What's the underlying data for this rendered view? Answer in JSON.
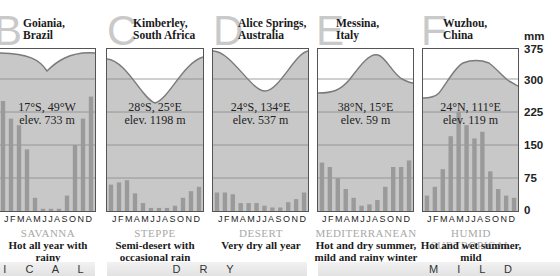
{
  "axis": {
    "unit": "mm",
    "ticks": [
      "375",
      "300",
      "225",
      "150",
      "75",
      "0"
    ]
  },
  "months_label": [
    "J",
    "F",
    "M",
    "A",
    "M",
    "J",
    "J",
    "A",
    "S",
    "O",
    "N",
    "D"
  ],
  "bands": {
    "tropical": "I C A L",
    "dry": "D R Y",
    "mild": "M I L D"
  },
  "panels": [
    {
      "letter": "B",
      "place_line1": "Goiania,",
      "place_line2": "Brazil",
      "coords": "17°S, 49°W",
      "elev": "elev. 733 m",
      "type": "SAVANNA",
      "desc_line1": "Hot all year with rainy",
      "desc_line2": "and dry seasons"
    },
    {
      "letter": "C",
      "place_line1": "Kimberley,",
      "place_line2": "South Africa",
      "coords": "28°S, 25°E",
      "elev": "elev. 1198 m",
      "type": "STEPPE",
      "desc_line1": "Semi-desert with",
      "desc_line2": "occasional rain"
    },
    {
      "letter": "D",
      "place_line1": "Alice Springs,",
      "place_line2": "Australia",
      "coords": "24°S, 134°E",
      "elev": "elev. 537 m",
      "type": "DESERT",
      "desc_line1": "Very dry all year",
      "desc_line2": ""
    },
    {
      "letter": "E",
      "place_line1": "Messina,",
      "place_line2": "Italy",
      "coords": "38°N, 15°E",
      "elev": "elev. 59 m",
      "type": "MEDITERRANEAN",
      "desc_line1": "Hot and dry summer,",
      "desc_line2": "mild and rainy winter"
    },
    {
      "letter": "F",
      "place_line1": "Wuzhou,",
      "place_line2": "China",
      "coords": "24°N, 111°E",
      "elev": "elev. 119 m",
      "type": "HUMID SUBTROPICAL",
      "desc_line1": "Hot and wet summer, mild",
      "desc_line2": "and damp winter"
    }
  ],
  "colors": {
    "bar": "#9a9a9a",
    "fill": "#c8c8c8",
    "line": "#7a7a7a",
    "grid": "#888888",
    "type_text": "#a8a8a8"
  },
  "chart_data": [
    {
      "type": "bar",
      "title": "Goiania, Brazil — Savanna",
      "categories": [
        "J",
        "F",
        "M",
        "A",
        "M",
        "J",
        "J",
        "A",
        "S",
        "O",
        "N",
        "D"
      ],
      "series": [
        {
          "name": "Precipitation (mm)",
          "values": [
            250,
            210,
            195,
            140,
            30,
            5,
            5,
            5,
            35,
            150,
            210,
            260
          ]
        }
      ],
      "temperature_curve": "high all year, slight dip Jun–Jul",
      "ylabel": "mm",
      "ylim": [
        0,
        375
      ]
    },
    {
      "type": "bar",
      "title": "Kimberley, South Africa — Steppe",
      "categories": [
        "J",
        "F",
        "M",
        "A",
        "M",
        "J",
        "J",
        "A",
        "S",
        "O",
        "N",
        "D"
      ],
      "series": [
        {
          "name": "Precipitation (mm)",
          "values": [
            60,
            65,
            70,
            40,
            18,
            7,
            7,
            7,
            12,
            30,
            45,
            55
          ]
        }
      ],
      "temperature_curve": "deep trough in Jun–Jul",
      "ylabel": "mm",
      "ylim": [
        0,
        375
      ]
    },
    {
      "type": "bar",
      "title": "Alice Springs, Australia — Desert",
      "categories": [
        "J",
        "F",
        "M",
        "A",
        "M",
        "J",
        "J",
        "A",
        "S",
        "O",
        "N",
        "D"
      ],
      "series": [
        {
          "name": "Precipitation (mm)",
          "values": [
            42,
            42,
            38,
            18,
            18,
            18,
            12,
            8,
            8,
            20,
            27,
            42
          ]
        }
      ],
      "temperature_curve": "deep trough in Jun–Jul",
      "ylabel": "mm",
      "ylim": [
        0,
        375
      ]
    },
    {
      "type": "bar",
      "title": "Messina, Italy — Mediterranean",
      "categories": [
        "J",
        "F",
        "M",
        "A",
        "M",
        "J",
        "J",
        "A",
        "S",
        "O",
        "N",
        "D"
      ],
      "series": [
        {
          "name": "Precipitation (mm)",
          "values": [
            110,
            100,
            75,
            50,
            30,
            12,
            15,
            25,
            55,
            100,
            100,
            115
          ]
        }
      ],
      "temperature_curve": "peak in Jul–Aug",
      "ylabel": "mm",
      "ylim": [
        0,
        375
      ]
    },
    {
      "type": "bar",
      "title": "Wuzhou, China — Humid Subtropical",
      "categories": [
        "J",
        "F",
        "M",
        "A",
        "M",
        "J",
        "J",
        "A",
        "S",
        "O",
        "N",
        "D"
      ],
      "series": [
        {
          "name": "Precipitation (mm)",
          "values": [
            35,
            55,
            95,
            170,
            225,
            195,
            165,
            180,
            90,
            50,
            35,
            30
          ]
        }
      ],
      "temperature_curve": "broad peak Jun–Aug",
      "ylabel": "mm",
      "ylim": [
        0,
        375
      ]
    }
  ]
}
